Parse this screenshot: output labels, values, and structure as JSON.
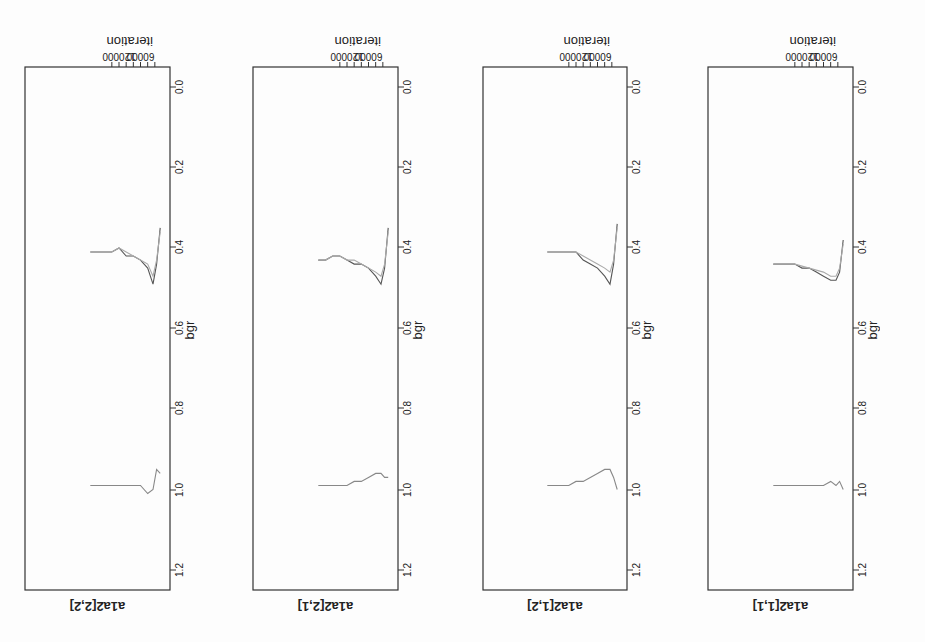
{
  "chart_data": [
    {
      "type": "line",
      "title": "a1a2[1,1]",
      "xlabel": "iteration",
      "ylabel": "bgr",
      "xticks": [
        60000,
        120000
      ],
      "yticks": [
        0.0,
        0.2,
        0.4,
        0.6,
        0.8,
        1.0,
        1.2
      ],
      "ylim": [
        0.0,
        1.25
      ],
      "series": [
        {
          "name": "pooled",
          "x": [
            5000,
            15000,
            25000,
            40000,
            60000,
            80000,
            100000,
            120000,
            140000,
            160000,
            180000,
            200000
          ],
          "values": [
            0.38,
            0.46,
            0.48,
            0.48,
            0.47,
            0.46,
            0.45,
            0.45,
            0.44,
            0.44,
            0.44,
            0.44
          ]
        },
        {
          "name": "within",
          "x": [
            5000,
            15000,
            25000,
            40000,
            60000,
            80000,
            100000,
            120000,
            140000,
            160000,
            180000,
            200000
          ],
          "values": [
            0.39,
            0.45,
            0.47,
            0.47,
            0.46,
            0.455,
            0.45,
            0.445,
            0.44,
            0.44,
            0.44,
            0.44
          ]
        },
        {
          "name": "ratio",
          "x": [
            5000,
            15000,
            25000,
            40000,
            60000,
            80000,
            100000,
            120000,
            140000,
            160000,
            180000,
            200000
          ],
          "values": [
            1.0,
            0.98,
            0.99,
            0.98,
            0.99,
            0.99,
            0.99,
            0.99,
            0.99,
            0.99,
            0.99,
            0.99
          ]
        }
      ]
    },
    {
      "type": "line",
      "title": "a1a2[1,2]",
      "xlabel": "iteration",
      "ylabel": "bgr",
      "xticks": [
        60000,
        120000
      ],
      "yticks": [
        0.0,
        0.2,
        0.4,
        0.6,
        0.8,
        1.0,
        1.2
      ],
      "ylim": [
        0.0,
        1.25
      ],
      "series": [
        {
          "name": "pooled",
          "x": [
            5000,
            15000,
            25000,
            40000,
            60000,
            80000,
            100000,
            120000,
            140000,
            160000,
            180000,
            200000
          ],
          "values": [
            0.34,
            0.44,
            0.49,
            0.47,
            0.45,
            0.44,
            0.43,
            0.41,
            0.41,
            0.41,
            0.41,
            0.41
          ]
        },
        {
          "name": "within",
          "x": [
            5000,
            15000,
            25000,
            40000,
            60000,
            80000,
            100000,
            120000,
            140000,
            160000,
            180000,
            200000
          ],
          "values": [
            0.35,
            0.43,
            0.46,
            0.45,
            0.44,
            0.43,
            0.42,
            0.41,
            0.41,
            0.41,
            0.41,
            0.41
          ]
        },
        {
          "name": "ratio",
          "x": [
            5000,
            15000,
            25000,
            40000,
            60000,
            80000,
            100000,
            120000,
            140000,
            160000,
            180000,
            200000
          ],
          "values": [
            1.0,
            0.97,
            0.95,
            0.95,
            0.96,
            0.97,
            0.98,
            0.98,
            0.99,
            0.99,
            0.99,
            0.99
          ]
        }
      ]
    },
    {
      "type": "line",
      "title": "a1a2[2,1]",
      "xlabel": "iteration",
      "ylabel": "bgr",
      "xticks": [
        60000,
        120000
      ],
      "yticks": [
        0.0,
        0.2,
        0.4,
        0.6,
        0.8,
        1.0,
        1.2
      ],
      "ylim": [
        0.0,
        1.25
      ],
      "series": [
        {
          "name": "pooled",
          "x": [
            5000,
            15000,
            25000,
            40000,
            60000,
            80000,
            100000,
            120000,
            140000,
            160000,
            180000,
            200000
          ],
          "values": [
            0.35,
            0.45,
            0.49,
            0.47,
            0.45,
            0.44,
            0.44,
            0.43,
            0.42,
            0.42,
            0.43,
            0.43
          ]
        },
        {
          "name": "within",
          "x": [
            5000,
            15000,
            25000,
            40000,
            60000,
            80000,
            100000,
            120000,
            140000,
            160000,
            180000,
            200000
          ],
          "values": [
            0.36,
            0.44,
            0.47,
            0.46,
            0.45,
            0.44,
            0.43,
            0.43,
            0.42,
            0.42,
            0.43,
            0.43
          ]
        },
        {
          "name": "ratio",
          "x": [
            5000,
            15000,
            25000,
            40000,
            60000,
            80000,
            100000,
            120000,
            140000,
            160000,
            180000,
            200000
          ],
          "values": [
            0.97,
            0.97,
            0.96,
            0.96,
            0.97,
            0.98,
            0.98,
            0.99,
            0.99,
            0.99,
            0.99,
            0.99
          ]
        }
      ]
    },
    {
      "type": "line",
      "title": "a1a2[2,2]",
      "xlabel": "iteration",
      "ylabel": "bgr",
      "xticks": [
        60000,
        120000
      ],
      "yticks": [
        0.0,
        0.2,
        0.4,
        0.6,
        0.8,
        1.0,
        1.2
      ],
      "ylim": [
        0.0,
        1.25
      ],
      "series": [
        {
          "name": "pooled",
          "x": [
            5000,
            15000,
            25000,
            40000,
            60000,
            80000,
            100000,
            120000,
            140000,
            160000,
            180000,
            200000
          ],
          "values": [
            0.35,
            0.44,
            0.49,
            0.45,
            0.43,
            0.42,
            0.42,
            0.4,
            0.41,
            0.41,
            0.41,
            0.41
          ]
        },
        {
          "name": "within",
          "x": [
            5000,
            15000,
            25000,
            40000,
            60000,
            80000,
            100000,
            120000,
            140000,
            160000,
            180000,
            200000
          ],
          "values": [
            0.36,
            0.43,
            0.47,
            0.44,
            0.43,
            0.42,
            0.41,
            0.4,
            0.41,
            0.41,
            0.41,
            0.41
          ]
        },
        {
          "name": "ratio",
          "x": [
            5000,
            15000,
            25000,
            40000,
            60000,
            80000,
            100000,
            120000,
            140000,
            160000,
            180000,
            200000
          ],
          "values": [
            0.96,
            0.95,
            1.0,
            1.01,
            0.99,
            0.99,
            0.99,
            0.99,
            0.99,
            0.99,
            0.99,
            0.99
          ]
        }
      ]
    }
  ],
  "panels": [
    {
      "title": "a1a2[1,1]",
      "xlabel": "iteration",
      "ylabel": "bgr",
      "xtick1": "60000",
      "xtick2": "120000",
      "yt0": "0.0",
      "yt1": "0.2",
      "yt2": "0.4",
      "yt3": "0.6",
      "yt4": "0.8",
      "yt5": "1.0",
      "yt6": "1.2"
    },
    {
      "title": "a1a2[1,2]",
      "xlabel": "iteration",
      "ylabel": "bgr",
      "xtick1": "60000",
      "xtick2": "120000",
      "yt0": "0.0",
      "yt1": "0.2",
      "yt2": "0.4",
      "yt3": "0.6",
      "yt4": "0.8",
      "yt5": "1.0",
      "yt6": "1.2"
    },
    {
      "title": "a1a2[2,1]",
      "xlabel": "iteration",
      "ylabel": "bgr",
      "xtick1": "60000",
      "xtick2": "120000",
      "yt0": "0.0",
      "yt1": "0.2",
      "yt2": "0.4",
      "yt3": "0.6",
      "yt4": "0.8",
      "yt5": "1.0",
      "yt6": "1.2"
    },
    {
      "title": "a1a2[2,2]",
      "xlabel": "iteration",
      "ylabel": "bgr",
      "xtick1": "60000",
      "xtick2": "120000",
      "yt0": "0.0",
      "yt1": "0.2",
      "yt2": "0.4",
      "yt3": "0.6",
      "yt4": "0.8",
      "yt5": "1.0",
      "yt6": "1.2"
    }
  ],
  "colors": {
    "axis": "#333333",
    "pooled": "#555555",
    "within": "#aaaaaa",
    "ratio": "#888888",
    "background": "#fdfdfd"
  }
}
